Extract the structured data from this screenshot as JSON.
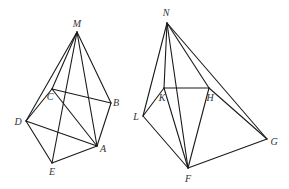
{
  "figures": [
    {
      "name": "pyramid-left",
      "apex": "M",
      "vertices": {
        "M": {
          "x": 77,
          "y": 32,
          "lx": 77,
          "ly": 27
        },
        "C": {
          "x": 52,
          "y": 89,
          "lx": 50,
          "ly": 100
        },
        "B": {
          "x": 111,
          "y": 103,
          "lx": 116,
          "ly": 106
        },
        "D": {
          "x": 26,
          "y": 121,
          "lx": 18,
          "ly": 125
        },
        "A": {
          "x": 97,
          "y": 146,
          "lx": 103,
          "ly": 152
        },
        "E": {
          "x": 52,
          "y": 163,
          "lx": 52,
          "ly": 175
        }
      },
      "edges": [
        [
          "M",
          "D"
        ],
        [
          "M",
          "C"
        ],
        [
          "M",
          "B"
        ],
        [
          "M",
          "A"
        ],
        [
          "M",
          "E"
        ],
        [
          "C",
          "B"
        ],
        [
          "C",
          "D"
        ],
        [
          "C",
          "A"
        ],
        [
          "B",
          "A"
        ],
        [
          "D",
          "A"
        ],
        [
          "D",
          "E"
        ],
        [
          "E",
          "A"
        ]
      ]
    },
    {
      "name": "pyramid-right",
      "apex": "N",
      "vertices": {
        "N": {
          "x": 167,
          "y": 23,
          "lx": 166,
          "ly": 16
        },
        "K": {
          "x": 164,
          "y": 88,
          "lx": 162,
          "ly": 101
        },
        "H": {
          "x": 209,
          "y": 88,
          "lx": 210,
          "ly": 101
        },
        "L": {
          "x": 143,
          "y": 116,
          "lx": 136,
          "ly": 120
        },
        "G": {
          "x": 267,
          "y": 139,
          "lx": 274,
          "ly": 145
        },
        "F": {
          "x": 188,
          "y": 168,
          "lx": 188,
          "ly": 182
        }
      },
      "edges": [
        [
          "N",
          "L"
        ],
        [
          "N",
          "K"
        ],
        [
          "N",
          "F"
        ],
        [
          "N",
          "H"
        ],
        [
          "N",
          "G"
        ],
        [
          "K",
          "H"
        ],
        [
          "K",
          "L"
        ],
        [
          "K",
          "F"
        ],
        [
          "H",
          "F"
        ],
        [
          "H",
          "G"
        ],
        [
          "L",
          "F"
        ],
        [
          "F",
          "G"
        ]
      ]
    }
  ],
  "labels": {
    "M": "M",
    "C": "C",
    "B": "B",
    "D": "D",
    "A": "A",
    "E": "E",
    "N": "N",
    "K": "K",
    "H": "H",
    "L": "L",
    "G": "G",
    "F": "F"
  },
  "colors": {
    "stroke": "#1a1a1a",
    "label": "#333333",
    "background": "#ffffff"
  }
}
